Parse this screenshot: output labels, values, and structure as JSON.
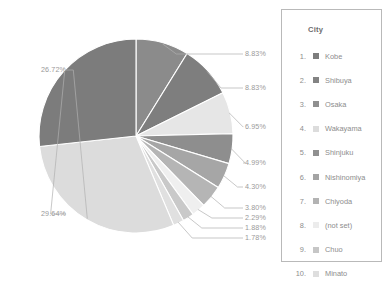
{
  "legend": {
    "title": "City",
    "rows": [
      {
        "rank": "1.",
        "label": "Kobe",
        "color": "#7d7d7d"
      },
      {
        "rank": "2.",
        "label": "Shibuya",
        "color": "#838383"
      },
      {
        "rank": "3.",
        "label": "Osaka",
        "color": "#8f8f8f"
      },
      {
        "rank": "4.",
        "label": "Wakayama",
        "color": "#dcdcdc"
      },
      {
        "rank": "5.",
        "label": "Shinjuku",
        "color": "#909090"
      },
      {
        "rank": "6.",
        "label": "Nishinomiya",
        "color": "#a4a4a4"
      },
      {
        "rank": "7.",
        "label": "Chiyoda",
        "color": "#b3b3b3"
      },
      {
        "rank": "8.",
        "label": "(not set)",
        "color": "#ececec"
      },
      {
        "rank": "9.",
        "label": "Chuo",
        "color": "#c6c6c6"
      },
      {
        "rank": "10.",
        "label": "Minato",
        "color": "#dedede"
      }
    ]
  },
  "chart_data": {
    "type": "pie",
    "title": "",
    "legend_position": "right",
    "legend_title": "City",
    "value_format": "percent",
    "categories": [
      "Kobe",
      "Shibuya",
      "Osaka",
      "Wakayama",
      "Shinjuku",
      "Nishinomiya",
      "Chiyoda",
      "(not set)",
      "Chuo",
      "Minato"
    ],
    "values": [
      29.64,
      26.72,
      8.83,
      8.83,
      6.95,
      4.99,
      4.3,
      3.8,
      2.29,
      1.88
    ],
    "slices": [
      {
        "name": "Shibuya",
        "value": 8.83,
        "label": "8.83%",
        "color": "#8b8b8b"
      },
      {
        "name": "Osaka",
        "value": 8.83,
        "label": "8.83%",
        "color": "#7e7e7e"
      },
      {
        "name": "Wakayama",
        "value": 6.95,
        "label": "6.95%",
        "color": "#e6e6e6"
      },
      {
        "name": "Shinjuku",
        "value": 4.99,
        "label": "4.99%",
        "color": "#8e8e8e"
      },
      {
        "name": "Nishinomiya",
        "value": 4.3,
        "label": "4.30%",
        "color": "#a6a6a6"
      },
      {
        "name": "Chiyoda",
        "value": 3.8,
        "label": "3.80%",
        "color": "#b5b5b5"
      },
      {
        "name": "(not set)",
        "value": 2.29,
        "label": "2.29%",
        "color": "#efefef"
      },
      {
        "name": "Chuo",
        "value": 1.88,
        "label": "1.88%",
        "color": "#c9c9c9"
      },
      {
        "name": "Minato",
        "value": 1.78,
        "label": "1.78%",
        "color": "#e0e0e0"
      },
      {
        "name": "Kobe",
        "value": 29.64,
        "label": "29.64%",
        "color": "#dcdcdc"
      },
      {
        "name": "(large-dark)",
        "value": 26.72,
        "label": "26.72%",
        "color": "#7c7c7c"
      }
    ],
    "labels": [
      {
        "text": "8.83%",
        "side": "right"
      },
      {
        "text": "8.83%",
        "side": "right"
      },
      {
        "text": "6.95%",
        "side": "right"
      },
      {
        "text": "4.99%",
        "side": "right"
      },
      {
        "text": "4.30%",
        "side": "right"
      },
      {
        "text": "3.80%",
        "side": "right"
      },
      {
        "text": "2.29%",
        "side": "right"
      },
      {
        "text": "1.88%",
        "side": "right"
      },
      {
        "text": "1.78%",
        "side": "right"
      },
      {
        "text": "26.72%",
        "side": "left"
      },
      {
        "text": "29.64%",
        "side": "left"
      }
    ]
  }
}
